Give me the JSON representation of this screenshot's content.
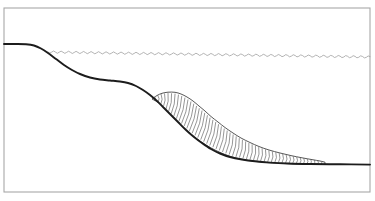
{
  "figure": {
    "title": "Submarine slope cross-section with landslide debris deposit",
    "type": "line-drawing-cross-section",
    "width": 375,
    "height": 201,
    "background_color": "#ffffff"
  },
  "frame": {
    "name": "figure-border",
    "x": 4,
    "y": 8,
    "width": 366,
    "height": 184,
    "stroke_color": "#a8a8a8",
    "stroke_width": 1.1,
    "fill": "#ffffff"
  },
  "water_surface": {
    "label": "sea-level wavy line",
    "stroke_color": "#9a9a9a",
    "stroke_width": 0.75,
    "start_x": 48,
    "end_x": 370,
    "y_left": 52,
    "y_right": 57,
    "wave_amplitude": 1.1,
    "wave_period": 7.5
  },
  "terrain": {
    "label": "slope profile / basal failure surface",
    "stroke_color": "#1c1c1c",
    "stroke_width": 1.9,
    "points": [
      [
        4,
        44
      ],
      [
        16,
        44
      ],
      [
        26,
        44.3
      ],
      [
        34,
        45.5
      ],
      [
        41,
        48.5
      ],
      [
        48,
        53
      ],
      [
        56,
        59
      ],
      [
        64,
        65
      ],
      [
        72,
        70
      ],
      [
        80,
        74
      ],
      [
        90,
        77.5
      ],
      [
        100,
        79.5
      ],
      [
        110,
        80.5
      ],
      [
        120,
        81.5
      ],
      [
        128,
        83
      ],
      [
        136,
        86
      ],
      [
        143,
        90
      ],
      [
        150,
        95
      ],
      [
        157,
        101
      ],
      [
        164,
        108
      ],
      [
        171,
        115
      ],
      [
        178,
        122
      ],
      [
        186,
        130
      ],
      [
        194,
        137
      ],
      [
        202,
        143
      ],
      [
        211,
        149
      ],
      [
        220,
        153.5
      ],
      [
        230,
        157
      ],
      [
        242,
        159.5
      ],
      [
        255,
        161.3
      ],
      [
        270,
        162.6
      ],
      [
        288,
        163.5
      ],
      [
        310,
        164
      ],
      [
        340,
        164.3
      ],
      [
        370,
        164.6
      ]
    ]
  },
  "deposit": {
    "label": "landslide debris lobe (hatched)",
    "outline_stroke": "#3a3a3a",
    "hatch_stroke": "#555555",
    "fill": "#ffffff",
    "crest_x": 176,
    "crest_y": 92,
    "toe_x": 325,
    "toe_y": 164,
    "head_x": 152,
    "head_y": 99,
    "upper_points": [
      [
        152,
        99
      ],
      [
        157,
        95.5
      ],
      [
        162,
        93.3
      ],
      [
        168,
        92.2
      ],
      [
        175,
        92.3
      ],
      [
        181,
        94
      ],
      [
        187,
        97
      ],
      [
        193,
        101
      ],
      [
        199,
        106
      ],
      [
        205,
        111
      ],
      [
        211,
        116.5
      ],
      [
        218,
        122
      ],
      [
        225,
        127.5
      ],
      [
        233,
        133
      ],
      [
        241,
        138
      ],
      [
        250,
        142.5
      ],
      [
        259,
        146.5
      ],
      [
        269,
        150
      ],
      [
        280,
        153
      ],
      [
        291,
        155.6
      ],
      [
        302,
        157.8
      ],
      [
        312,
        159.6
      ],
      [
        320,
        161
      ],
      [
        325,
        162.2
      ]
    ],
    "lower_points": [
      [
        152,
        99
      ],
      [
        159,
        103
      ],
      [
        166,
        110
      ],
      [
        173,
        117
      ],
      [
        181,
        125
      ],
      [
        189,
        132.5
      ],
      [
        197,
        139
      ],
      [
        206,
        145
      ],
      [
        215,
        150
      ],
      [
        225,
        154.5
      ],
      [
        236,
        158
      ],
      [
        248,
        160.4
      ],
      [
        262,
        162.1
      ],
      [
        278,
        163.2
      ],
      [
        296,
        163.9
      ],
      [
        312,
        164.2
      ],
      [
        325,
        164.4
      ]
    ],
    "hatch_count": 54,
    "hatch_description": "closely spaced small scalloped loops normal to the basal surface"
  }
}
